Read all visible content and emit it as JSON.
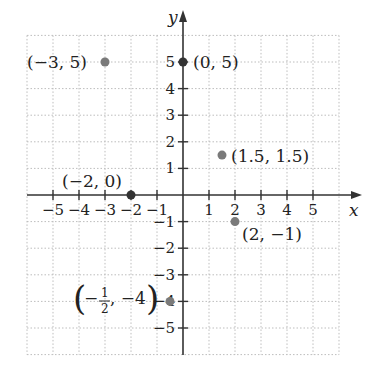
{
  "chart_data": {
    "type": "scatter",
    "title": "",
    "xlabel": "x",
    "ylabel": "y",
    "xlim": [
      -6,
      6
    ],
    "ylim": [
      -6,
      6
    ],
    "grid": true,
    "grid_style": "dotted",
    "x_ticks": [
      -5,
      -4,
      -3,
      -2,
      -1,
      1,
      2,
      3,
      4,
      5
    ],
    "y_ticks": [
      -5,
      -4,
      -3,
      -2,
      -1,
      1,
      2,
      3,
      4,
      5
    ],
    "x_tick_labels": [
      "−5",
      "−4",
      "−3",
      "−2",
      "−1",
      "1",
      "2",
      "3",
      "4",
      "5"
    ],
    "y_tick_labels": [
      "−5",
      "−4",
      "−3",
      "−2",
      "−1",
      "1",
      "2",
      "3",
      "4",
      "5"
    ],
    "points": [
      {
        "x": -3,
        "y": 5,
        "label": "(−3, 5)",
        "color": "#7a7a7a"
      },
      {
        "x": 0,
        "y": 5,
        "label": "(0, 5)",
        "color": "#333333"
      },
      {
        "x": 1.5,
        "y": 1.5,
        "label": "(1.5, 1.5)",
        "color": "#7a7a7a"
      },
      {
        "x": -2,
        "y": 0,
        "label": "(−2, 0)",
        "color": "#333333"
      },
      {
        "x": 2,
        "y": -1,
        "label": "(2, −1)",
        "color": "#7a7a7a"
      },
      {
        "x": -0.5,
        "y": -4,
        "label": "(−1/2, −4)",
        "color": "#7a7a7a"
      }
    ]
  },
  "colors": {
    "axis": "#333333",
    "grid": "#bdbdbd",
    "point_gray": "#7a7a7a",
    "point_dark": "#333333"
  }
}
